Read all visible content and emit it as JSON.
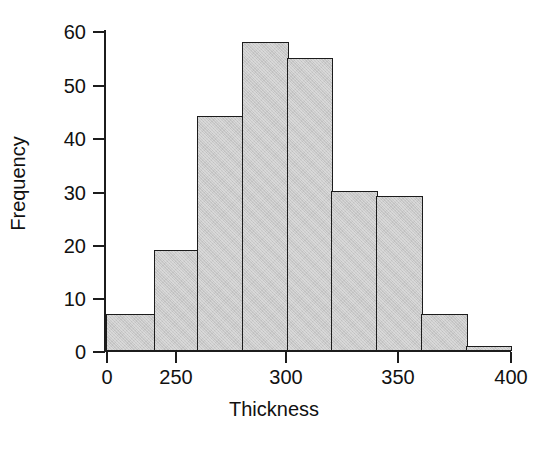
{
  "figure": {
    "width": 548,
    "height": 455,
    "background": "#ffffff"
  },
  "chart_data": {
    "type": "bar",
    "title": "",
    "subtitle": "",
    "xlabel": "Thickness",
    "ylabel": "Frequency",
    "categories": [
      "0-230",
      "230-250",
      "250-270",
      "270-290",
      "290-310",
      "310-330",
      "330-350",
      "350-370",
      "370-400"
    ],
    "bin_edges": [
      0,
      230,
      250,
      270,
      290,
      310,
      330,
      350,
      370,
      400
    ],
    "values": [
      7,
      19,
      44,
      58,
      55,
      30,
      29,
      7,
      1
    ],
    "x_ticks": [
      0,
      250,
      300,
      350,
      400
    ],
    "x_tick_labels": [
      "0",
      "250",
      "300",
      "350",
      "400"
    ],
    "y_ticks": [
      0,
      10,
      20,
      30,
      40,
      50,
      60
    ],
    "y_tick_labels": [
      "0",
      "10",
      "20",
      "30",
      "40",
      "50",
      "60"
    ],
    "ylim": [
      0,
      61
    ],
    "xlim": [
      0,
      400
    ],
    "grid": false,
    "legend": false,
    "legend_position": "none",
    "bar_fill_color": "#c9c9c9",
    "bar_edge_color": "#1c1c1c",
    "axis_color": "#1c1c1c",
    "note": "x-axis is drawn with a compressed first interval (0 to 250) so all nine bins render at equal pixel width"
  },
  "layout": {
    "plot_left_px": 105,
    "plot_top_px": 25,
    "plot_width_px": 406,
    "plot_height_px": 326,
    "baseline_y_px": 351,
    "px_per_unit_y": 5.333,
    "bar_edges_px": [
      106,
      154,
      197,
      242,
      287,
      331,
      376,
      421,
      466,
      510
    ],
    "x_tick_px": [
      106,
      175,
      285,
      397,
      510
    ],
    "y_tick_px": [
      351,
      298,
      245,
      192,
      138,
      85,
      31
    ]
  }
}
